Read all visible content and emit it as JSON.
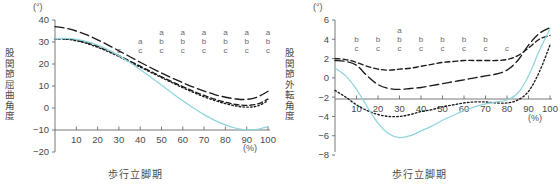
{
  "figure": {
    "background": "#ffffff",
    "panels": [
      "left",
      "right"
    ]
  },
  "left_panel": {
    "unit": "(°)",
    "ylabel": "股関節屈曲角度",
    "xlabel": "歩行立脚期",
    "percent_label": "(%)",
    "yticks": [
      "40",
      "30",
      "20",
      "10",
      "0",
      "-10",
      "-20"
    ],
    "xticks": [
      "10",
      "20",
      "30",
      "40",
      "50",
      "60",
      "70",
      "80",
      "90",
      "100"
    ],
    "annotations": [
      {
        "x": 30,
        "text": "c"
      },
      {
        "x": 40,
        "text": "a\nc"
      },
      {
        "x": 50,
        "text": "a\nb\nc"
      },
      {
        "x": 60,
        "text": "a\nb\nc"
      },
      {
        "x": 70,
        "text": "a\nb\nc"
      },
      {
        "x": 80,
        "text": "a\nb\nc"
      },
      {
        "x": 90,
        "text": "a\nb\nc"
      },
      {
        "x": 100,
        "text": "a\nb\nc"
      }
    ]
  },
  "right_panel": {
    "unit": "(°)",
    "ylabel": "股関節外転角度",
    "xlabel": "歩行立脚期",
    "percent_label": "(%)",
    "yticks": [
      "6",
      "4",
      "2",
      "0",
      "-2",
      "-4",
      "-6",
      "-8"
    ],
    "xticks": [
      "10",
      "20",
      "30",
      "40",
      "50",
      "60",
      "70",
      "80",
      "90",
      "100"
    ],
    "annotations": [
      {
        "x": 10,
        "text": "b\nc"
      },
      {
        "x": 20,
        "text": "b\nc"
      },
      {
        "x": 30,
        "text": "a\nb\nc"
      },
      {
        "x": 40,
        "text": "b\nc"
      },
      {
        "x": 50,
        "text": "b\nc"
      },
      {
        "x": 60,
        "text": "b\nc"
      },
      {
        "x": 70,
        "text": "b\nc"
      },
      {
        "x": 80,
        "text": "c"
      }
    ]
  },
  "chart_data": [
    {
      "type": "line",
      "title": "",
      "xlabel": "歩行立脚期",
      "ylabel": "股関節屈曲角度",
      "unit": "(°)",
      "xunit": "(%)",
      "xlim": [
        0,
        100
      ],
      "ylim": [
        -20,
        40
      ],
      "yticks": [
        40,
        30,
        20,
        10,
        0,
        -10,
        -20
      ],
      "xticks": [
        10,
        20,
        30,
        40,
        50,
        60,
        70,
        80,
        90,
        100
      ],
      "grid": false,
      "legend": "none",
      "x": [
        0,
        5,
        10,
        15,
        20,
        25,
        30,
        35,
        40,
        45,
        50,
        55,
        60,
        65,
        70,
        75,
        80,
        85,
        90,
        95,
        100
      ],
      "series": [
        {
          "name": "long-dash",
          "style": "long-dash",
          "color": "#1a1a1a",
          "values": [
            37.0,
            36.3,
            35.0,
            33.2,
            31.0,
            28.6,
            26.0,
            23.4,
            20.8,
            18.3,
            15.9,
            13.6,
            11.5,
            9.5,
            7.7,
            6.1,
            4.9,
            4.1,
            3.9,
            5.0,
            7.6
          ]
        },
        {
          "name": "dashed",
          "style": "dashed",
          "color": "#1a1a1a",
          "values": [
            31.5,
            31.4,
            30.8,
            29.6,
            28.0,
            26.0,
            23.8,
            21.4,
            19.0,
            16.6,
            14.2,
            11.9,
            9.7,
            7.6,
            5.7,
            4.0,
            2.6,
            1.6,
            1.2,
            1.8,
            4.0
          ]
        },
        {
          "name": "dotted",
          "style": "dotted",
          "color": "#1a1a1a",
          "values": [
            31.5,
            31.3,
            30.6,
            29.3,
            27.6,
            25.6,
            23.4,
            21.0,
            18.6,
            16.2,
            13.8,
            11.5,
            9.2,
            7.1,
            5.1,
            3.4,
            2.0,
            0.9,
            0.4,
            0.9,
            3.3
          ]
        },
        {
          "name": "cyan-solid",
          "style": "solid",
          "color": "#8fd4dd",
          "values": [
            31.5,
            31.6,
            31.2,
            30.2,
            28.6,
            26.4,
            23.8,
            20.8,
            17.5,
            14.0,
            10.4,
            6.8,
            3.3,
            0.0,
            -3.0,
            -5.6,
            -7.7,
            -9.2,
            -9.9,
            -9.7,
            -8.4
          ]
        }
      ],
      "annotations": [
        {
          "x": 30,
          "letters": [
            "c"
          ]
        },
        {
          "x": 40,
          "letters": [
            "a",
            "c"
          ]
        },
        {
          "x": 50,
          "letters": [
            "a",
            "b",
            "c"
          ]
        },
        {
          "x": 60,
          "letters": [
            "a",
            "b",
            "c"
          ]
        },
        {
          "x": 70,
          "letters": [
            "a",
            "b",
            "c"
          ]
        },
        {
          "x": 80,
          "letters": [
            "a",
            "b",
            "c"
          ]
        },
        {
          "x": 90,
          "letters": [
            "a",
            "b",
            "c"
          ]
        },
        {
          "x": 100,
          "letters": [
            "a",
            "b",
            "c"
          ]
        }
      ]
    },
    {
      "type": "line",
      "title": "",
      "xlabel": "歩行立脚期",
      "ylabel": "股関節外転角度",
      "unit": "(°)",
      "xunit": "(%)",
      "xlim": [
        0,
        100
      ],
      "ylim": [
        -8,
        6
      ],
      "yticks": [
        6,
        4,
        2,
        0,
        -2,
        -4,
        -6,
        -8
      ],
      "xticks": [
        10,
        20,
        30,
        40,
        50,
        60,
        70,
        80,
        90,
        100
      ],
      "grid": false,
      "legend": "none",
      "x": [
        0,
        5,
        10,
        15,
        20,
        25,
        30,
        35,
        40,
        45,
        50,
        55,
        60,
        65,
        70,
        75,
        80,
        85,
        90,
        95,
        100
      ],
      "series": [
        {
          "name": "dashed",
          "style": "dashed",
          "color": "#1a1a1a",
          "values": [
            2.0,
            1.9,
            1.6,
            1.2,
            0.9,
            0.8,
            0.9,
            1.0,
            1.2,
            1.4,
            1.6,
            1.7,
            1.8,
            1.8,
            1.8,
            1.8,
            1.9,
            2.3,
            3.1,
            4.0,
            4.4
          ]
        },
        {
          "name": "long-dash",
          "style": "long-dash",
          "color": "#1a1a1a",
          "values": [
            1.8,
            1.7,
            1.3,
            0.2,
            -0.7,
            -1.1,
            -1.2,
            -1.1,
            -1.0,
            -0.8,
            -0.6,
            -0.4,
            -0.2,
            0.0,
            0.2,
            0.4,
            0.8,
            1.8,
            3.4,
            4.6,
            5.2
          ]
        },
        {
          "name": "dotted",
          "style": "dotted",
          "color": "#1a1a1a",
          "values": [
            -1.3,
            -2.0,
            -2.8,
            -3.4,
            -3.8,
            -4.0,
            -4.0,
            -3.8,
            -3.5,
            -3.3,
            -3.0,
            -2.8,
            -2.6,
            -2.5,
            -2.5,
            -2.6,
            -2.6,
            -2.3,
            -1.4,
            0.6,
            3.4
          ]
        },
        {
          "name": "cyan-solid",
          "style": "solid",
          "color": "#8fd4dd",
          "values": [
            1.0,
            0.2,
            -1.2,
            -3.0,
            -4.7,
            -5.8,
            -6.2,
            -6.0,
            -5.5,
            -5.0,
            -4.4,
            -3.9,
            -3.4,
            -3.0,
            -2.7,
            -2.5,
            -2.3,
            -1.6,
            0.2,
            2.8,
            5.1
          ]
        }
      ],
      "annotations": [
        {
          "x": 10,
          "letters": [
            "b",
            "c"
          ]
        },
        {
          "x": 20,
          "letters": [
            "b",
            "c"
          ]
        },
        {
          "x": 30,
          "letters": [
            "a",
            "b",
            "c"
          ]
        },
        {
          "x": 40,
          "letters": [
            "b",
            "c"
          ]
        },
        {
          "x": 50,
          "letters": [
            "b",
            "c"
          ]
        },
        {
          "x": 60,
          "letters": [
            "b",
            "c"
          ]
        },
        {
          "x": 70,
          "letters": [
            "b",
            "c"
          ]
        },
        {
          "x": 80,
          "letters": [
            "c"
          ]
        }
      ]
    }
  ]
}
